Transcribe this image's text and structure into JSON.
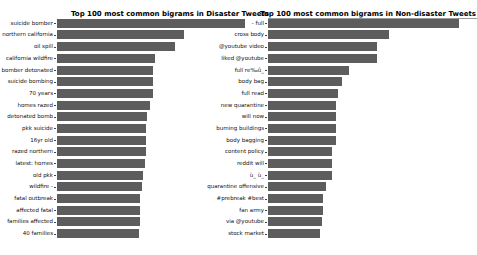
{
  "figure": {
    "background": "#ffffff",
    "bar_color": "#5d5d5d",
    "label_color": "#111111",
    "title_color": "#000000"
  },
  "chart_data": [
    {
      "type": "bar",
      "orientation": "horizontal",
      "title": "Top 100 most common bigrams in Disaster Tweets",
      "categories": [
        "suicide bomber",
        "northern california",
        "oil spill",
        "california wildfire",
        "bomber detonated",
        "suicide bombing",
        "70 years",
        "homes razed",
        "detonated bomb",
        "pkk suicide",
        "16yr old",
        "razed northern",
        "latest: homes",
        "old pkk",
        "wildfire -",
        "fatal outbreak",
        "affected fatal",
        "families affected",
        "40 families"
      ],
      "values": [
        100,
        67.5,
        62.8,
        52.1,
        51.1,
        51.1,
        51.1,
        49.5,
        47.9,
        47.3,
        47.3,
        47.3,
        46.8,
        45.7,
        45.2,
        44.1,
        44.1,
        44.1,
        43.6
      ],
      "xlim": [
        0,
        100
      ],
      "grid": false,
      "legend": "none",
      "value_note": "x-axis cropped out of frame; values are relative bar lengths with longest bar = 100",
      "plot": {
        "bar_start_x": 57,
        "max_bar_px": 188,
        "first_bar_top": 18.8,
        "row_pitch": 11.68,
        "bar_height": 9,
        "title_center_x": 170,
        "title_top": 10
      }
    },
    {
      "type": "bar",
      "orientation": "horizontal",
      "title": "Top 100 most common bigrams in Non-disaster Tweets",
      "categories": [
        "- full",
        "cross body",
        "@youtube video",
        "liked @youtube",
        "full re‰û_",
        "body bag",
        "full read",
        "new quarantine",
        "will now",
        "burning buildings",
        "body bagging",
        "content policy",
        "reddit will",
        "ù_ ù_",
        "quarantine offensive",
        "#prebreak #best",
        "fan army",
        "via @youtube",
        "stock market"
      ],
      "values": [
        100,
        63.4,
        57.1,
        57.1,
        42.4,
        38.7,
        36.6,
        35.6,
        35.6,
        35.6,
        35.6,
        33.5,
        33.5,
        33.5,
        30.4,
        28.8,
        28.8,
        28.3,
        27.2
      ],
      "xlim": [
        0,
        100
      ],
      "grid": false,
      "legend": "none",
      "value_note": "x-axis cropped out of frame; values are relative bar lengths with longest bar = 100",
      "plot": {
        "bar_start_x": 268,
        "max_bar_px": 191,
        "first_bar_top": 18.8,
        "row_pitch": 11.68,
        "bar_height": 9,
        "title_center_x": 368,
        "title_top": 10,
        "spine_top": {
          "y": 18,
          "width": 209
        }
      }
    }
  ]
}
